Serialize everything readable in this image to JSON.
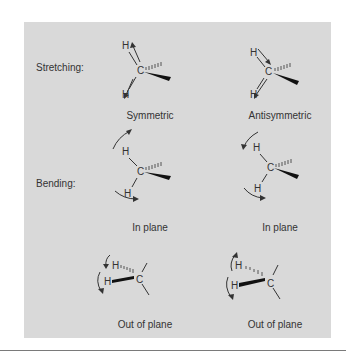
{
  "figure": {
    "rows": [
      {
        "label": "Stretching:",
        "modes": [
          {
            "caption": "Symmetric",
            "atoms": {
              "top": "H",
              "center": "C",
              "bottom": "H"
            }
          },
          {
            "caption": "Antisymmetric",
            "atoms": {
              "top": "H",
              "center": "C",
              "bottom": "H"
            }
          }
        ]
      },
      {
        "label": "Bending:",
        "modes": [
          {
            "caption": "In plane",
            "atoms": {
              "top": "H",
              "center": "C",
              "bottom": "H"
            }
          },
          {
            "caption": "In plane",
            "atoms": {
              "top": "H",
              "center": "C",
              "bottom": "H"
            }
          }
        ]
      },
      {
        "label": "",
        "modes": [
          {
            "caption": "Out of plane",
            "atoms": {
              "top": "H",
              "center": "C",
              "bottom": "H"
            }
          },
          {
            "caption": "Out of plane",
            "atoms": {
              "top": "H",
              "center": "C",
              "bottom": "H"
            }
          }
        ]
      }
    ],
    "colors": {
      "panel": "#d9d9d9",
      "ink": "#333333",
      "rule": "#7a7a7a"
    }
  }
}
